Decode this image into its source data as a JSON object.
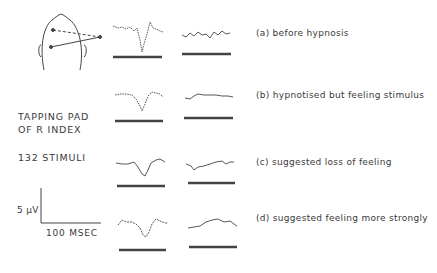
{
  "figure": {
    "head_diagram": {
      "description": "head outline with electrode placements"
    },
    "stimulus_site": {
      "line1": "TAPPING PAD",
      "line2": "OF R INDEX"
    },
    "stimulus_count": "132 STIMULI",
    "scale_bar": {
      "voltage": "5 μV",
      "time": "100 MSEC"
    },
    "conditions": [
      {
        "id": "a",
        "label": "(a)  before hypnosis"
      },
      {
        "id": "b",
        "label": "(b)  hypnotised but feeling  stimulus"
      },
      {
        "id": "c",
        "label": "(c)  suggested loss of  feeling"
      },
      {
        "id": "d",
        "label": "(d)  suggested feeling  more  strongly"
      }
    ],
    "traces": {
      "columns": [
        "contralateral",
        "ipsilateral"
      ],
      "rows": 4
    }
  },
  "colors": {
    "ink": "#333333",
    "background": "#ffffff"
  }
}
